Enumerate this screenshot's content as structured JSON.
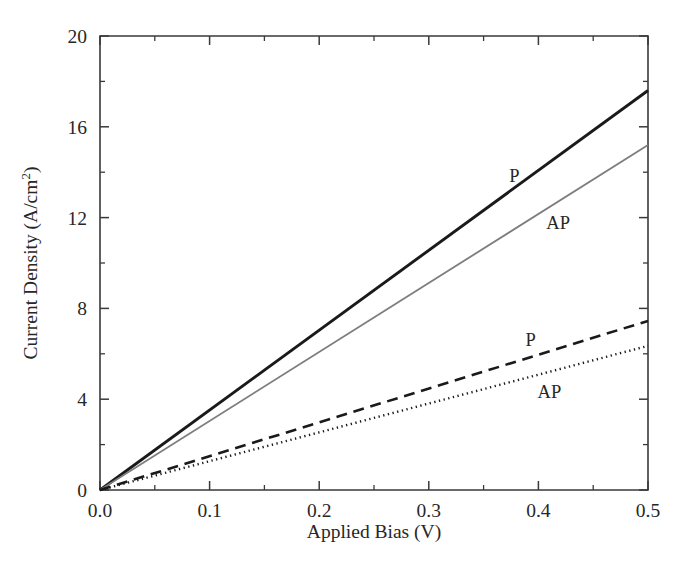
{
  "chart_data": {
    "type": "line",
    "title": "",
    "xlabel": "Applied Bias (V)",
    "ylabel": "Current Density (A/cm",
    "ylabel_superscript": "2",
    "ylabel_suffix": ")",
    "xlim": [
      0.0,
      0.5
    ],
    "ylim": [
      0,
      20
    ],
    "grid": false,
    "legend_position": "inline-labels",
    "xticks": [
      "0.0",
      "0.1",
      "0.2",
      "0.3",
      "0.4",
      "0.5"
    ],
    "xtick_values": [
      0.0,
      0.1,
      0.2,
      0.3,
      0.4,
      0.5
    ],
    "xminor_values": [
      0.05,
      0.15,
      0.25,
      0.35,
      0.45
    ],
    "yticks": [
      "0",
      "4",
      "8",
      "12",
      "16",
      "20"
    ],
    "ytick_values": [
      0,
      4,
      8,
      12,
      16,
      20
    ],
    "yminor_values": [
      2,
      6,
      10,
      14,
      18
    ],
    "x": [
      0.0,
      0.5
    ],
    "series": [
      {
        "name": "P",
        "label": "P",
        "style": "solid",
        "color": "#1a1a1a",
        "width": 2.9,
        "values": [
          0.0,
          17.6
        ],
        "label_x": 0.378,
        "label_y": 13.55
      },
      {
        "name": "AP",
        "label": "AP",
        "style": "solid",
        "color": "#7d7d7d",
        "width": 1.8,
        "values": [
          0.0,
          15.2
        ],
        "label_x": 0.418,
        "label_y": 11.5
      },
      {
        "name": "P-dashed",
        "label": "P",
        "style": "dashed",
        "color": "#1a1a1a",
        "width": 2.6,
        "values": [
          0.0,
          7.45
        ],
        "label_x": 0.393,
        "label_y": 6.35
      },
      {
        "name": "AP-dotted",
        "label": "AP",
        "style": "dotted",
        "color": "#1a1a1a",
        "width": 2.4,
        "values": [
          0.0,
          6.35
        ],
        "label_x": 0.41,
        "label_y": 4.05
      }
    ]
  }
}
